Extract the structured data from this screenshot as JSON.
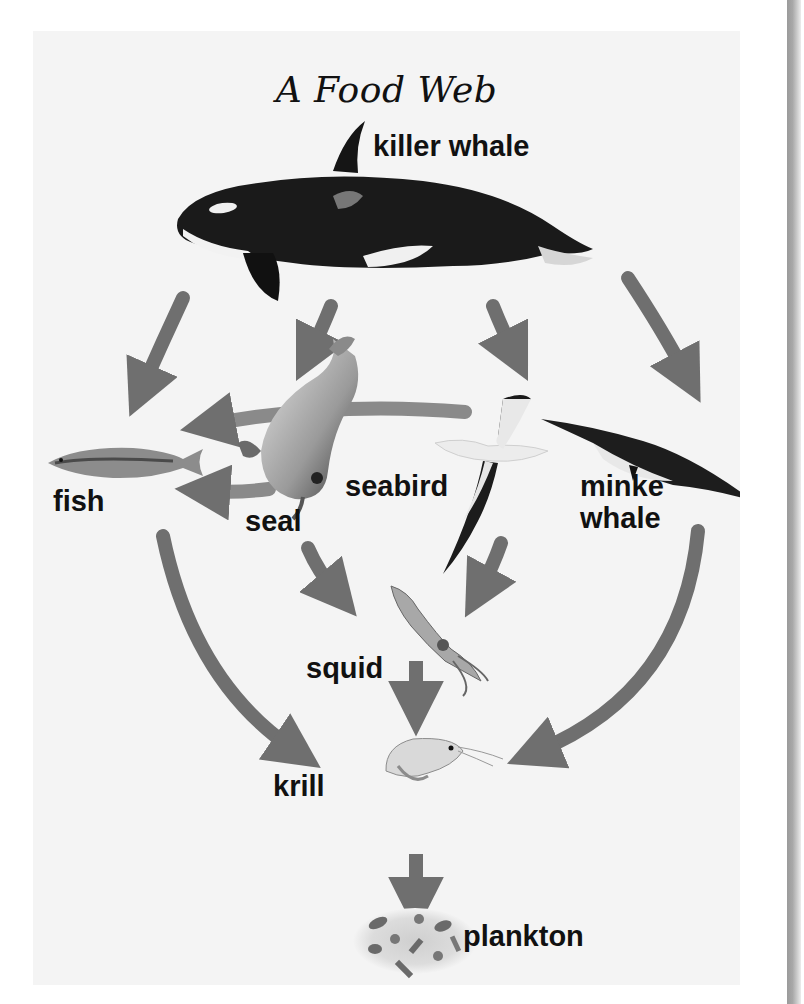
{
  "diagram": {
    "title": "A Food Web",
    "arrow_color": "#6f6f6f",
    "background_color": "#f4f4f4",
    "organisms": [
      {
        "id": "killer_whale",
        "label": "killer whale"
      },
      {
        "id": "seal",
        "label": "seal"
      },
      {
        "id": "seabird",
        "label": "seabird"
      },
      {
        "id": "fish",
        "label": "fish"
      },
      {
        "id": "minke_whale",
        "label": "minke\nwhale",
        "label_line1": "minke",
        "label_line2": "whale"
      },
      {
        "id": "squid",
        "label": "squid"
      },
      {
        "id": "krill",
        "label": "krill"
      },
      {
        "id": "plankton",
        "label": "plankton"
      }
    ],
    "arrows": [
      {
        "from": "killer whale",
        "to": "fish"
      },
      {
        "from": "killer whale",
        "to": "seal"
      },
      {
        "from": "killer whale",
        "to": "seabird"
      },
      {
        "from": "killer whale",
        "to": "minke whale"
      },
      {
        "from": "seabird",
        "to": "fish"
      },
      {
        "from": "seal",
        "to": "fish"
      },
      {
        "from": "seal",
        "to": "squid"
      },
      {
        "from": "seabird",
        "to": "squid"
      },
      {
        "from": "fish",
        "to": "krill"
      },
      {
        "from": "minke whale",
        "to": "krill"
      },
      {
        "from": "squid",
        "to": "krill"
      },
      {
        "from": "krill",
        "to": "plankton"
      }
    ]
  }
}
